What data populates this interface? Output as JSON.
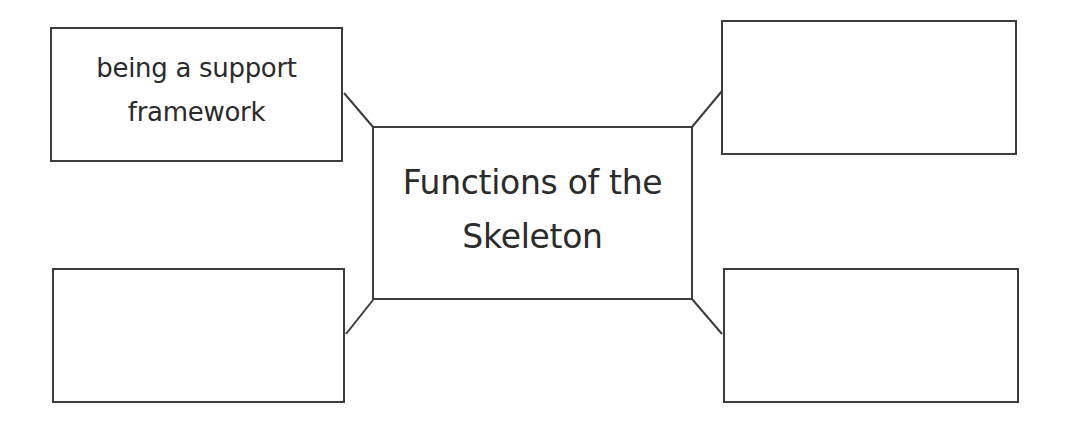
{
  "diagram": {
    "type": "spider-map",
    "center": {
      "lines": [
        "Functions of the",
        "Skeleton"
      ]
    },
    "nodes": [
      {
        "position": "top-left",
        "lines": [
          "being a support",
          "framework"
        ]
      },
      {
        "position": "top-right",
        "lines": []
      },
      {
        "position": "bottom-left",
        "lines": []
      },
      {
        "position": "bottom-right",
        "lines": []
      }
    ],
    "colors": {
      "stroke": "#3c3c3c",
      "text": "#2b2b2b",
      "background": "#ffffff"
    }
  }
}
